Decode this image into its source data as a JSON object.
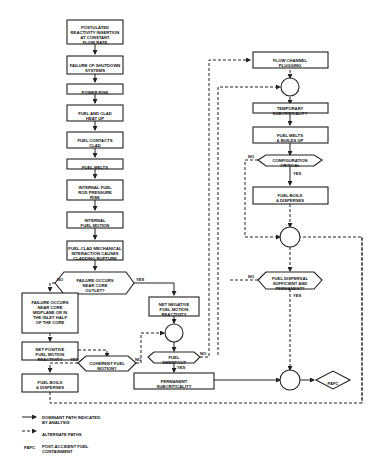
{
  "nodes": {
    "n1": [
      "POSTULATED",
      "REACTIVITY INSERTION",
      "AT CONSTANT",
      "FLOW RATE"
    ],
    "n2": [
      "FAILURE OF SHUTDOWN",
      "SYSTEMS"
    ],
    "n3": [
      "POWER RISE"
    ],
    "n4": [
      "FUEL AND CLAD",
      "HEAT UP"
    ],
    "n5": [
      "FUEL CONTACTS",
      "CLAD"
    ],
    "n6": [
      "FUEL MELTS"
    ],
    "n7": [
      "INTERNAL FUEL",
      "ROD PRESSURE",
      "RISE"
    ],
    "n8": [
      "INTERNAL",
      "FUEL MOTION"
    ],
    "n9": [
      "FUEL-CLAD MECHANICAL",
      "INTERACTION CAUSES",
      "CLADDING RUPTURE"
    ],
    "d1": [
      "FAILURE OCCURS",
      "NEAR CORE",
      "OUTLET?"
    ],
    "n10": [
      "FAILURE OCCURS",
      "NEAR CORE",
      "MIDPLANE OR IN",
      "THE INLET HALF",
      "OF THE CORE"
    ],
    "n11": [
      "NET NEGATIVE",
      "FUEL MOTION",
      "REACTIVITY"
    ],
    "n12": [
      "NET POSITIVE",
      "FUEL MOTION",
      "REACTIVITY"
    ],
    "d2": [
      "COHERENT FUEL",
      "MOTION?"
    ],
    "d3": [
      "FUEL",
      "SWEEPOUT"
    ],
    "n13": [
      "FUEL BOILS",
      "& DISPERSES"
    ],
    "n14": [
      "PERMANENT",
      "SUBCRITICALITY"
    ],
    "r1": [
      "FLOW CHANNEL",
      "PLUGGING"
    ],
    "r2": [
      "TEMPORARY",
      "SUBCRITICALITY"
    ],
    "r3": [
      "FUEL MELTS",
      "& BUILDS UP"
    ],
    "d4": [
      "CONFIGURATION",
      "CRITICAL"
    ],
    "r4": [
      "FUEL BOILS",
      "& DISPERSES"
    ],
    "d5": [
      "FUEL DISPERSAL",
      "SUFFICIENT AND",
      "PERMANENT?"
    ],
    "pafc": [
      "PAFC"
    ]
  },
  "edge_labels": {
    "yes": "YES",
    "no": "NO"
  },
  "legend": {
    "dominant": [
      "DOMINANT PATH INDICATED",
      "BY ANALYSIS"
    ],
    "alternate": [
      "ALTERNATE PATHS"
    ],
    "pafc_abbr": "PAFC",
    "pafc_def": [
      "POST-ACCIDENT FUEL",
      "CONTAINMENT"
    ]
  }
}
